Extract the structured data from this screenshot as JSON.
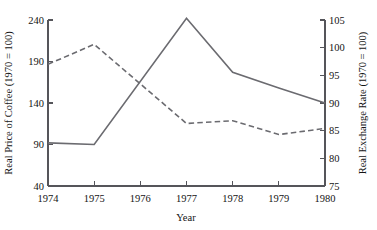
{
  "chart_data": {
    "type": "line",
    "title": "",
    "xlabel": "Year",
    "ylabel": "Real Price of Coffee (1970 = 100)",
    "y2label": "Real Exchange Rate (1970 = 100)",
    "categories": [
      1974,
      1975,
      1976,
      1977,
      1978,
      1979,
      1980
    ],
    "x_tick_labels": [
      "1974",
      "1975",
      "1976",
      "1977",
      "1978",
      "1979",
      "1980"
    ],
    "xlim": [
      1974,
      1980
    ],
    "ylim": [
      40,
      240
    ],
    "y_ticks": [
      40,
      90,
      140,
      190,
      240
    ],
    "y_tick_labels": [
      "40",
      "90",
      "140",
      "190",
      "240"
    ],
    "y2lim": [
      75,
      105
    ],
    "y2_ticks": [
      75,
      80,
      85,
      90,
      95,
      100,
      105
    ],
    "y2_tick_labels": [
      "75",
      "80",
      "85",
      "90",
      "95",
      "100",
      "105"
    ],
    "grid": false,
    "legend": "none",
    "series": [
      {
        "name": "Real Price of Coffee",
        "axis": "left",
        "style": "solid",
        "color": "#6b6b70",
        "x": [
          1974,
          1975,
          1977,
          1978,
          1979,
          1980
        ],
        "values": [
          92,
          90,
          242,
          177,
          158,
          140
        ]
      },
      {
        "name": "Real Exchange Rate",
        "axis": "right",
        "style": "dashed",
        "color": "#6b6b70",
        "x": [
          1974,
          1975,
          1977,
          1978,
          1979,
          1980
        ],
        "values": [
          97.0,
          100.6,
          86.3,
          86.8,
          84.3,
          85.4
        ]
      }
    ]
  },
  "axes": {
    "left_title": "Real Price of Coffee (1970 = 100)",
    "right_title": "Real Exchange Rate (1970 = 100)",
    "x_title": "Year"
  },
  "colors": {
    "line": "#6b6b70",
    "axis": "#55555a",
    "text": "#141414",
    "background": "#ffffff"
  }
}
